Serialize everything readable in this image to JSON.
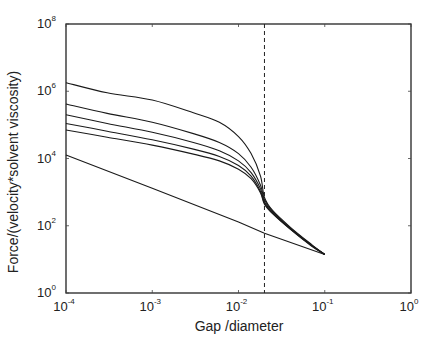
{
  "chart_data": {
    "type": "line",
    "title": "",
    "xlabel": "Gap /diameter",
    "ylabel": "Force/(velocity*solvent viscosity)",
    "xscale": "log",
    "yscale": "log",
    "xlim": [
      0.0001,
      1
    ],
    "ylim": [
      1,
      100000000
    ],
    "grid": false,
    "legend": "none",
    "x_ticks": [
      {
        "base": "10",
        "exp": "-4",
        "value": 0.0001
      },
      {
        "base": "10",
        "exp": "-3",
        "value": 0.001
      },
      {
        "base": "10",
        "exp": "-2",
        "value": 0.01
      },
      {
        "base": "10",
        "exp": "-1",
        "value": 0.1
      },
      {
        "base": "10",
        "exp": "0",
        "value": 1
      }
    ],
    "y_ticks": [
      {
        "base": "10",
        "exp": "0",
        "value": 1
      },
      {
        "base": "10",
        "exp": "2",
        "value": 100
      },
      {
        "base": "10",
        "exp": "4",
        "value": 10000
      },
      {
        "base": "10",
        "exp": "6",
        "value": 1000000
      },
      {
        "base": "10",
        "exp": "8",
        "value": 100000000
      }
    ],
    "annotations": [
      {
        "type": "vertical-dashed-line",
        "x": 0.02
      }
    ],
    "series": [
      {
        "name": "curve-1",
        "x": [
          0.0001,
          0.0003,
          0.001,
          0.003,
          0.006,
          0.01,
          0.014,
          0.018,
          0.02,
          0.025,
          0.04,
          0.07,
          0.1
        ],
        "y": [
          1800000,
          900000,
          550000,
          230000,
          120000,
          45000,
          14000,
          3000,
          700,
          280,
          90,
          28,
          14
        ]
      },
      {
        "name": "curve-2",
        "x": [
          0.0001,
          0.0003,
          0.001,
          0.003,
          0.006,
          0.01,
          0.014,
          0.018,
          0.02,
          0.025,
          0.04,
          0.07,
          0.1
        ],
        "y": [
          420000,
          220000,
          120000,
          55000,
          30000,
          14000,
          5500,
          1600,
          600,
          260,
          85,
          27,
          14
        ]
      },
      {
        "name": "curve-3",
        "x": [
          0.0001,
          0.0003,
          0.001,
          0.003,
          0.006,
          0.01,
          0.014,
          0.018,
          0.02,
          0.025,
          0.04,
          0.07,
          0.1
        ],
        "y": [
          200000,
          110000,
          60000,
          30000,
          17000,
          8500,
          3800,
          1250,
          520,
          245,
          82,
          26,
          14
        ]
      },
      {
        "name": "curve-4",
        "x": [
          0.0001,
          0.0003,
          0.001,
          0.003,
          0.006,
          0.01,
          0.014,
          0.018,
          0.02,
          0.025,
          0.04,
          0.07,
          0.1
        ],
        "y": [
          110000,
          65000,
          36000,
          19000,
          11500,
          6200,
          3000,
          1050,
          470,
          235,
          80,
          26,
          14
        ]
      },
      {
        "name": "curve-5",
        "x": [
          0.0001,
          0.0003,
          0.001,
          0.003,
          0.006,
          0.01,
          0.014,
          0.018,
          0.02,
          0.025,
          0.04,
          0.07,
          0.1
        ],
        "y": [
          70000,
          43000,
          25000,
          13500,
          8500,
          4800,
          2500,
          950,
          440,
          225,
          78,
          25,
          14
        ]
      },
      {
        "name": "asymptote-1/h",
        "x": [
          0.0001,
          0.001,
          0.01,
          0.02,
          0.1
        ],
        "y": [
          12800,
          1300,
          130,
          60,
          14
        ]
      }
    ]
  }
}
